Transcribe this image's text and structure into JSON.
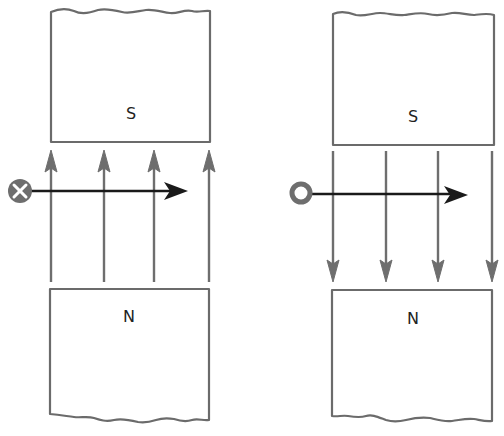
{
  "diagram": {
    "type": "magnetic-field-force-on-conductor",
    "colors": {
      "magnet_outline": "#6b6b6b",
      "field_line": "#6e6e6e",
      "force_arrow": "#1a1a1a",
      "conductor": "#6e6e6e",
      "background": "#ffffff"
    },
    "panels": [
      {
        "id": "left",
        "top_magnet": {
          "label": "S"
        },
        "bottom_magnet": {
          "label": "N"
        },
        "field_direction": "up",
        "field_line_count": 4,
        "conductor_symbol": "cross",
        "conductor_meaning": "current into page",
        "force_direction": "right"
      },
      {
        "id": "right",
        "top_magnet": {
          "label": "S"
        },
        "bottom_magnet": {
          "label": "N"
        },
        "field_direction": "down",
        "field_line_count": 4,
        "conductor_symbol": "dot",
        "conductor_meaning": "current out of page",
        "force_direction": "right"
      }
    ]
  }
}
